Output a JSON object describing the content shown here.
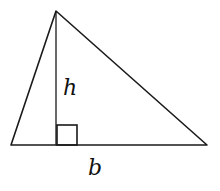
{
  "diagram": {
    "type": "triangle-area",
    "labels": {
      "height": "h",
      "base": "b"
    },
    "vertices": {
      "apex": [
        56,
        11
      ],
      "bottom_left": [
        11,
        145
      ],
      "bottom_right": [
        207,
        145
      ]
    },
    "altitude": {
      "from": [
        56,
        11
      ],
      "to": [
        56,
        145
      ]
    },
    "right_angle_marker": {
      "x": 57,
      "y": 125,
      "size": 20
    },
    "colors": {
      "stroke": "#1a1a1a",
      "background": "#ffffff"
    }
  }
}
